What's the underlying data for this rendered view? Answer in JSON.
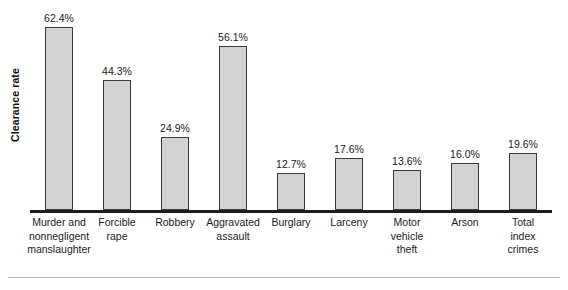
{
  "chart_data": {
    "type": "bar",
    "title": "",
    "xlabel": "",
    "ylabel": "Clearance rate",
    "ylim": [
      0,
      70
    ],
    "grid": false,
    "legend": "none",
    "orientation": "vertical",
    "bar_fill_color": "#d2d2d2",
    "bar_border_color": "#3a3a3a",
    "axis_color": "#1c1c1c",
    "categories": [
      "Murder and nonnegligent manslaughter",
      "Forcible rape",
      "Robbery",
      "Aggravated assault",
      "Burglary",
      "Larceny",
      "Motor vehicle theft",
      "Arson",
      "Total index crimes"
    ],
    "category_lines": [
      [
        "Murder and",
        "nonnegligent",
        "manslaughter"
      ],
      [
        "Forcible",
        "rape"
      ],
      [
        "Robbery"
      ],
      [
        "Aggravated",
        "assault"
      ],
      [
        "Burglary"
      ],
      [
        "Larceny"
      ],
      [
        "Motor",
        "vehicle",
        "theft"
      ],
      [
        "Arson"
      ],
      [
        "Total",
        "index",
        "crimes"
      ]
    ],
    "values": [
      62.4,
      44.3,
      24.9,
      56.1,
      12.7,
      17.6,
      13.6,
      16.0,
      19.6
    ],
    "value_labels": [
      "62.4%",
      "44.3%",
      "24.9%",
      "56.1%",
      "12.7%",
      "17.6%",
      "13.6%",
      "16.0%",
      "19.6%"
    ]
  }
}
